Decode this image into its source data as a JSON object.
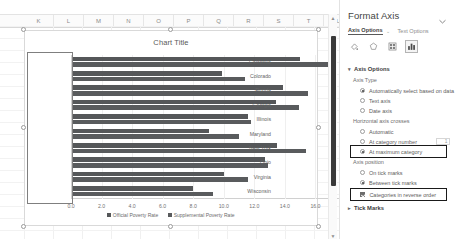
{
  "spreadsheet": {
    "column_headers": [
      "K",
      "L",
      "M",
      "N",
      "O",
      "P",
      "Q",
      "R",
      "S",
      "T",
      "U"
    ]
  },
  "chart_data": {
    "type": "bar",
    "orientation": "horizontal",
    "title": "Chart Title",
    "xlabel": "",
    "ylabel": "",
    "xlim": [
      0,
      18
    ],
    "xticks": [
      "0.0",
      "2.0",
      "4.0",
      "6.0",
      "8.0",
      "10.0",
      "12.0",
      "14.0",
      "16.0",
      "18.0"
    ],
    "xtick_values": [
      0,
      2,
      4,
      6,
      8,
      10,
      12,
      14,
      16,
      18
    ],
    "grid": true,
    "legend_position": "bottom",
    "categories": [
      "California",
      "Colorado",
      "Florida",
      "Georgia",
      "Illinois",
      "Maryland",
      "New York",
      "Ohio",
      "Virginia",
      "Wisconsin"
    ],
    "series": [
      {
        "name": "Official Poverty Rate",
        "color": "#555759",
        "values": [
          15.0,
          9.9,
          13.9,
          13.4,
          11.6,
          9.0,
          13.5,
          12.7,
          10.0,
          8.0
        ]
      },
      {
        "name": "Supplemental Poverty Rate",
        "color": "#595b5d",
        "values": [
          17.3,
          11.4,
          15.5,
          14.9,
          11.8,
          11.0,
          15.4,
          12.9,
          11.6,
          9.3
        ]
      }
    ]
  },
  "pane": {
    "title": "Format Axis",
    "collapse_icon": "chevron-down-icon",
    "tabs": [
      {
        "label": "Axis Options",
        "active": true,
        "caret": "⌄"
      },
      {
        "label": "Text Options",
        "active": false
      }
    ],
    "icons": [
      {
        "name": "fill-line-icon",
        "selected": false
      },
      {
        "name": "effects-icon",
        "selected": false
      },
      {
        "name": "size-properties-icon",
        "selected": false
      },
      {
        "name": "axis-options-chart-icon",
        "selected": true
      }
    ],
    "sections": [
      {
        "name": "axis-options",
        "header": "Axis Options",
        "expanded": true,
        "triangle": "▾",
        "groups": [
          {
            "label": "Axis Type",
            "options": [
              {
                "label": "Automatically select based on data",
                "type": "radio",
                "selected": true
              },
              {
                "label": "Text axis",
                "type": "radio",
                "selected": false
              },
              {
                "label": "Date axis",
                "type": "radio",
                "selected": false
              }
            ]
          },
          {
            "label": "Horizontal axis crosses",
            "options": [
              {
                "label": "Automatic",
                "type": "radio",
                "selected": false
              },
              {
                "label": "At category number",
                "type": "radio",
                "selected": false,
                "input_value": "1"
              },
              {
                "label": "At maximum category",
                "type": "radio",
                "selected": true,
                "highlighted": true
              }
            ]
          },
          {
            "label": "Axis position",
            "options": [
              {
                "label": "On tick marks",
                "type": "radio",
                "selected": false
              },
              {
                "label": "Between tick marks",
                "type": "radio",
                "selected": true
              }
            ]
          },
          {
            "label": "",
            "options": [
              {
                "label": "Categories in reverse order",
                "type": "checkbox",
                "selected": true,
                "highlighted": true
              }
            ]
          }
        ]
      },
      {
        "name": "tick-marks",
        "header": "Tick Marks",
        "expanded": false,
        "triangle": "▸"
      }
    ]
  }
}
